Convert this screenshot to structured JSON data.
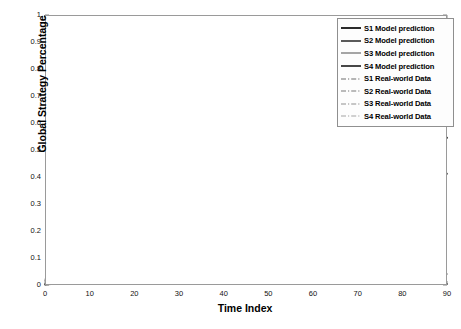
{
  "chart_data": {
    "type": "line",
    "title": "",
    "xlabel": "Time Index",
    "ylabel": "Global Strategy Percentage",
    "xlim": [
      0,
      90
    ],
    "ylim": [
      0,
      1
    ],
    "xticks": [
      "0",
      "10",
      "20",
      "30",
      "40",
      "50",
      "60",
      "70",
      "80",
      "90"
    ],
    "yticks": [
      "0",
      "0.1",
      "0.2",
      "0.3",
      "0.4",
      "0.5",
      "0.6",
      "0.7",
      "0.8",
      "0.9",
      "1"
    ],
    "grid": true,
    "legend_position": "top-right",
    "x": [
      0,
      2,
      4,
      6,
      8,
      10,
      12,
      14,
      16,
      18,
      20,
      22,
      24,
      26,
      28,
      30,
      32,
      34,
      36,
      38,
      40,
      45,
      50,
      55,
      60,
      65,
      70,
      75,
      80,
      85,
      90
    ],
    "series": [
      {
        "name": "S1 Model prediction",
        "style": "solid",
        "color": "#2b2b2b",
        "width": 2.0,
        "values": [
          0.995,
          0.985,
          0.972,
          0.957,
          0.94,
          0.921,
          0.9,
          0.876,
          0.85,
          0.822,
          0.792,
          0.762,
          0.731,
          0.702,
          0.674,
          0.649,
          0.627,
          0.608,
          0.593,
          0.581,
          0.572,
          0.559,
          0.553,
          0.55,
          0.548,
          0.547,
          0.546,
          0.546,
          0.545,
          0.545,
          0.545
        ]
      },
      {
        "name": "S2 Model prediction",
        "style": "solid",
        "color": "#5a5a5a",
        "width": 2.0,
        "values": [
          0.002,
          0.005,
          0.012,
          0.027,
          0.05,
          0.08,
          0.116,
          0.155,
          0.195,
          0.234,
          0.27,
          0.301,
          0.328,
          0.35,
          0.368,
          0.382,
          0.392,
          0.399,
          0.404,
          0.407,
          0.409,
          0.411,
          0.412,
          0.412,
          0.412,
          0.412,
          0.412,
          0.412,
          0.412,
          0.412,
          0.412
        ]
      },
      {
        "name": "S3 Model prediction",
        "style": "solid",
        "color": "#8f8f8f",
        "width": 1.6,
        "values": [
          0.018,
          0.03,
          0.045,
          0.058,
          0.067,
          0.073,
          0.076,
          0.077,
          0.077,
          0.075,
          0.073,
          0.07,
          0.066,
          0.063,
          0.059,
          0.056,
          0.053,
          0.051,
          0.049,
          0.047,
          0.046,
          0.044,
          0.043,
          0.042,
          0.042,
          0.041,
          0.041,
          0.041,
          0.041,
          0.041,
          0.041
        ]
      },
      {
        "name": "S4 Model prediction",
        "style": "solid",
        "color": "#1a1a1a",
        "width": 1.6,
        "values": [
          0.003,
          0.003,
          0.004,
          0.004,
          0.004,
          0.004,
          0.004,
          0.004,
          0.004,
          0.004,
          0.004,
          0.004,
          0.004,
          0.004,
          0.004,
          0.004,
          0.004,
          0.004,
          0.004,
          0.004,
          0.004,
          0.004,
          0.004,
          0.004,
          0.004,
          0.004,
          0.004,
          0.004,
          0.004,
          0.004,
          0.004
        ]
      },
      {
        "name": "S1 Real-world Data",
        "style": "dashdot",
        "color": "#6e6e6e",
        "width": 1.1,
        "values": [
          0.998,
          0.99,
          0.978,
          0.962,
          0.944,
          0.924,
          0.903,
          0.881,
          0.86,
          0.84,
          0.822,
          0.808,
          0.8,
          0.797,
          0.79,
          0.775,
          0.752,
          0.726,
          0.7,
          0.678,
          0.66,
          0.627,
          0.6,
          0.58,
          0.566,
          0.557,
          0.551,
          0.548,
          0.546,
          0.545,
          0.545
        ]
      },
      {
        "name": "S2 Real-world Data",
        "style": "dashdot",
        "color": "#7a7a7a",
        "width": 1.1,
        "values": [
          0.001,
          0.006,
          0.02,
          0.045,
          0.08,
          0.122,
          0.165,
          0.205,
          0.243,
          0.275,
          0.303,
          0.325,
          0.341,
          0.352,
          0.361,
          0.369,
          0.376,
          0.383,
          0.389,
          0.394,
          0.398,
          0.404,
          0.408,
          0.41,
          0.411,
          0.412,
          0.412,
          0.413,
          0.413,
          0.413,
          0.413
        ]
      },
      {
        "name": "S3 Real-world Data",
        "style": "dashdot",
        "color": "#909090",
        "width": 1.1,
        "values": [
          0.022,
          0.026,
          0.029,
          0.032,
          0.034,
          0.036,
          0.038,
          0.04,
          0.042,
          0.043,
          0.045,
          0.046,
          0.047,
          0.048,
          0.048,
          0.048,
          0.047,
          0.047,
          0.046,
          0.046,
          0.045,
          0.044,
          0.043,
          0.042,
          0.042,
          0.041,
          0.041,
          0.041,
          0.041,
          0.041,
          0.041
        ]
      },
      {
        "name": "S4 Real-world Data",
        "style": "dashdot",
        "color": "#a3a3a3",
        "width": 1.1,
        "values": [
          0.004,
          0.004,
          0.004,
          0.005,
          0.005,
          0.005,
          0.005,
          0.005,
          0.005,
          0.005,
          0.005,
          0.005,
          0.005,
          0.005,
          0.005,
          0.005,
          0.005,
          0.005,
          0.005,
          0.005,
          0.005,
          0.005,
          0.005,
          0.005,
          0.005,
          0.005,
          0.005,
          0.005,
          0.005,
          0.005,
          0.005
        ]
      }
    ]
  },
  "legend": {
    "items": [
      {
        "label": "S1 Model prediction"
      },
      {
        "label": "S2 Model prediction"
      },
      {
        "label": "S3 Model prediction"
      },
      {
        "label": "S4 Model prediction"
      },
      {
        "label": "S1 Real-world Data"
      },
      {
        "label": "S2 Real-world Data"
      },
      {
        "label": "S3 Real-world Data"
      },
      {
        "label": "S4 Real-world Data"
      }
    ]
  }
}
